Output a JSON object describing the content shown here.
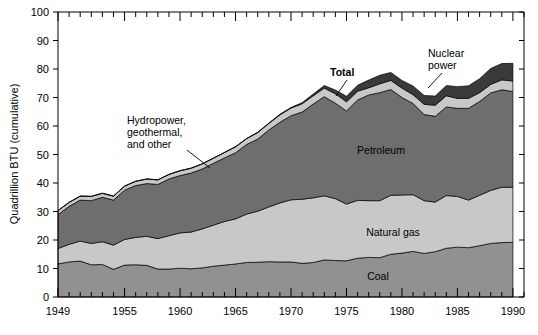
{
  "chart_data": {
    "type": "area",
    "title": "",
    "xlabel": "",
    "ylabel": "Quadrillion BTU (cumulative)",
    "ylim": [
      0,
      100
    ],
    "xlim": [
      1949,
      1991
    ],
    "ytick_labels": [
      "0",
      "10",
      "20",
      "30",
      "40",
      "50",
      "60",
      "70",
      "80",
      "90",
      "100"
    ],
    "ytick_values": [
      0,
      10,
      20,
      30,
      40,
      50,
      60,
      70,
      80,
      90,
      100
    ],
    "xtick_labels": [
      "1949",
      "1955",
      "1960",
      "1965",
      "1970",
      "1975",
      "1980",
      "1985",
      "1990"
    ],
    "xtick_values": [
      1949,
      1955,
      1960,
      1965,
      1970,
      1975,
      1980,
      1985,
      1990
    ],
    "xtick_minor_step": 1,
    "grid": false,
    "legend_position": "inline-labels",
    "stacked": true,
    "x": [
      1949,
      1950,
      1951,
      1952,
      1953,
      1954,
      1955,
      1956,
      1957,
      1958,
      1959,
      1960,
      1961,
      1962,
      1963,
      1964,
      1965,
      1966,
      1967,
      1968,
      1969,
      1970,
      1971,
      1972,
      1973,
      1974,
      1975,
      1976,
      1977,
      1978,
      1979,
      1980,
      1981,
      1982,
      1983,
      1984,
      1985,
      1986,
      1987,
      1988,
      1989,
      1990
    ],
    "series": [
      {
        "name": "Coal",
        "color": "#919191",
        "values": [
          11.6,
          12.3,
          12.6,
          11.3,
          11.4,
          9.7,
          11.2,
          11.3,
          11.1,
          9.8,
          9.8,
          10.1,
          9.9,
          10.2,
          10.8,
          11.2,
          11.6,
          12.1,
          12.2,
          12.4,
          12.3,
          12.3,
          11.8,
          12.1,
          13.0,
          12.8,
          12.7,
          13.6,
          13.9,
          13.8,
          15.0,
          15.4,
          16.0,
          15.3,
          15.9,
          17.1,
          17.5,
          17.3,
          18.0,
          18.8,
          19.1,
          19.2
        ]
      },
      {
        "name": "Natural gas",
        "color": "#c8c8c8",
        "values": [
          5.4,
          6.2,
          7.0,
          7.5,
          8.0,
          8.5,
          9.0,
          9.6,
          10.2,
          10.7,
          11.7,
          12.4,
          12.9,
          13.7,
          14.4,
          15.3,
          15.8,
          17.0,
          17.9,
          19.2,
          20.7,
          21.8,
          22.5,
          22.7,
          22.5,
          21.7,
          19.9,
          20.3,
          19.9,
          20.0,
          20.7,
          20.4,
          19.9,
          18.5,
          17.4,
          18.5,
          17.8,
          16.7,
          17.7,
          18.6,
          19.4,
          19.3
        ]
      },
      {
        "name": "Petroleum",
        "color": "#6e6e6e",
        "values": [
          11.9,
          13.3,
          14.4,
          15.0,
          15.6,
          15.8,
          17.3,
          18.2,
          18.5,
          19.0,
          19.9,
          20.1,
          20.7,
          21.0,
          21.7,
          22.3,
          23.2,
          24.4,
          25.3,
          27.0,
          28.3,
          29.5,
          30.6,
          32.9,
          34.8,
          33.5,
          32.7,
          35.2,
          37.1,
          37.9,
          37.1,
          34.2,
          32.0,
          30.2,
          30.1,
          31.1,
          30.9,
          32.2,
          32.9,
          34.2,
          34.2,
          33.6
        ]
      },
      {
        "name": "Hydropower, geothermal, and other",
        "color": "#c8c8c8",
        "values": [
          1.4,
          1.4,
          1.4,
          1.5,
          1.4,
          1.4,
          1.4,
          1.5,
          1.6,
          1.6,
          1.6,
          1.7,
          1.7,
          1.8,
          1.8,
          1.9,
          2.1,
          2.1,
          2.3,
          2.3,
          2.6,
          2.7,
          2.9,
          2.9,
          3.0,
          3.3,
          3.2,
          3.1,
          2.5,
          3.1,
          3.2,
          3.3,
          3.1,
          3.6,
          3.9,
          3.9,
          3.5,
          3.5,
          3.1,
          3.0,
          3.5,
          3.7
        ]
      },
      {
        "name": "Nuclear power",
        "color": "#3a3a3a",
        "values": [
          0.0,
          0.0,
          0.0,
          0.0,
          0.0,
          0.0,
          0.0,
          0.0,
          0.0,
          0.0,
          0.0,
          0.0,
          0.0,
          0.0,
          0.0,
          0.0,
          0.0,
          0.0,
          0.1,
          0.1,
          0.2,
          0.2,
          0.4,
          0.6,
          0.9,
          1.3,
          1.9,
          2.1,
          2.7,
          3.0,
          2.8,
          2.7,
          3.0,
          3.1,
          3.2,
          3.6,
          4.1,
          4.4,
          4.9,
          5.6,
          5.7,
          6.2
        ]
      }
    ]
  },
  "annotations": {
    "total": {
      "label": "Total",
      "bold": true
    },
    "nuclear": {
      "label_line1": "Nuclear",
      "label_line2": "power"
    },
    "hydro": {
      "label_line1": "Hydropower,",
      "label_line2": "geothermal,",
      "label_line3": "and other"
    },
    "petroleum": {
      "label": "Petroleum"
    },
    "natural_gas": {
      "label": "Natural gas"
    },
    "coal": {
      "label": "Coal"
    }
  },
  "colors": {
    "coal": "#919191",
    "natural_gas": "#c8c8c8",
    "petroleum": "#6e6e6e",
    "hydro": "#c8c8c8",
    "nuclear": "#3a3a3a",
    "axis": "#000000",
    "background": "#ffffff"
  }
}
